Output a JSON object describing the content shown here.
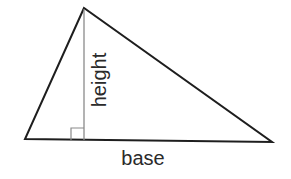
{
  "diagram": {
    "labels": {
      "height": "height",
      "base": "base"
    },
    "colors": {
      "outline": "#1e1e1e",
      "height_line": "#8a8a8a",
      "text": "#2a2a2a",
      "background": "#ffffff"
    },
    "shapes": {
      "triangle": {
        "apex": [
          84,
          8
        ],
        "base_left": [
          25,
          139
        ],
        "base_right": [
          272,
          142
        ]
      },
      "altitude": {
        "x": 84,
        "y_top": 8,
        "y_bottom": 140
      },
      "right_angle_marker": {
        "x": 71,
        "y": 128,
        "size": 12
      }
    }
  }
}
